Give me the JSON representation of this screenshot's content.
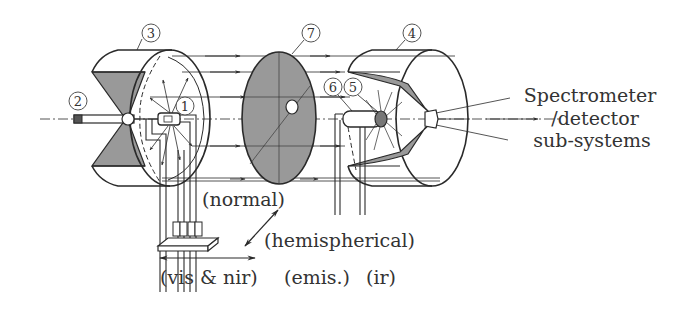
{
  "diagram": {
    "type": "optical-schematic",
    "components": [
      {
        "id": "1",
        "label": "1",
        "desc": "sample / source at center of left hemisphere"
      },
      {
        "id": "2",
        "label": "2",
        "desc": "input probe / rod"
      },
      {
        "id": "3",
        "label": "3",
        "desc": "left hemispherical mirror"
      },
      {
        "id": "4",
        "label": "4",
        "desc": "right hemispherical mirror"
      },
      {
        "id": "5",
        "label": "5",
        "desc": "sample at focus of right hemisphere"
      },
      {
        "id": "6",
        "label": "6",
        "desc": "holder / heater"
      },
      {
        "id": "7",
        "label": "7",
        "desc": "central disk with aperture"
      }
    ],
    "labels": {
      "output": [
        "Spectrometer",
        "/detector",
        "sub-systems"
      ],
      "normal": "(normal)",
      "hemispherical": "(hemispherical)",
      "vis_nir": "(vis & nir)",
      "emis": "(emis.)",
      "ir": "(ir)"
    },
    "colors": {
      "ink": "#2a2a2a",
      "shade": "#999999",
      "text": "#333333",
      "background": "#ffffff"
    }
  }
}
